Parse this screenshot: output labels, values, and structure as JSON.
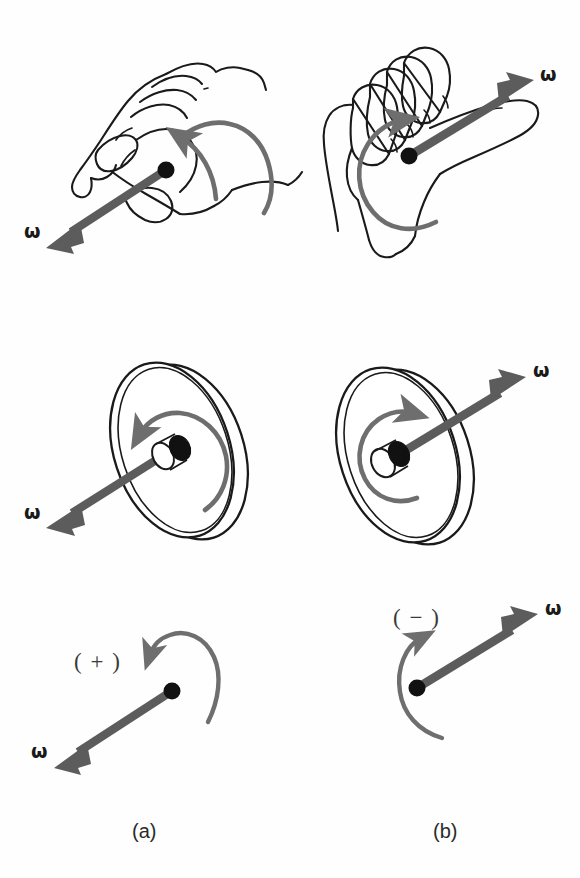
{
  "figure": {
    "background_color": "#fefefe",
    "width": 580,
    "height": 878,
    "ink_color": "#1a1a1a",
    "vector_color": "#5c5c5c",
    "spin_arrow_color": "#6e6e6e"
  },
  "columns": [
    {
      "id": "a",
      "caption": "(a)",
      "sense": "counterclockwise-viewed-from-front",
      "vector_direction": "down-left",
      "sign_label": "( + )"
    },
    {
      "id": "b",
      "caption": "(b)",
      "sense": "clockwise-viewed-from-front",
      "vector_direction": "up-right",
      "sign_label": "( − )"
    }
  ],
  "rows": [
    {
      "id": "hand",
      "name": "right-hand-grip-illustration"
    },
    {
      "id": "wheel",
      "name": "spinning-wheel-illustration"
    },
    {
      "id": "vector",
      "name": "abstract-vector-illustration"
    }
  ],
  "labels": {
    "omega": "ω",
    "omega_hand_a": "ω",
    "omega_hand_b": "ω",
    "omega_wheel_a": "ω",
    "omega_wheel_b": "ω",
    "omega_vector_a": "ω",
    "omega_vector_b": "ω",
    "sign_a": "( + )",
    "sign_b": "( − )",
    "caption_a": "(a)",
    "caption_b": "(b)"
  }
}
